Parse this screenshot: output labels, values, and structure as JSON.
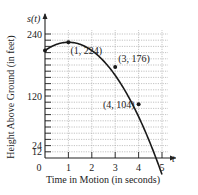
{
  "chart_data": {
    "type": "line",
    "title": "",
    "xlabel": "Time in Motion (in seconds)",
    "ylabel": "Height Above Ground (in feet)",
    "x_axis_symbol": "t",
    "y_axis_symbol": "s(t)",
    "xlim": [
      0,
      5
    ],
    "ylim": [
      0,
      240
    ],
    "x_ticks": [
      0,
      1,
      2,
      3,
      4,
      5
    ],
    "x_tick_labels": [
      "0",
      "1",
      "2",
      "3",
      "4",
      "5"
    ],
    "y_ticks": [
      0,
      12,
      24,
      120,
      240
    ],
    "y_tick_labels": [
      "0",
      "12",
      "24",
      "120",
      "240"
    ],
    "y_grid_step": 12,
    "x_grid_step": 1,
    "grid": true,
    "function": "s(t) = -16t^2 + 32t + 208",
    "series": [
      {
        "name": "s(t)",
        "x": [
          0,
          0.5,
          1,
          1.5,
          2,
          2.5,
          3,
          3.5,
          4,
          4.5,
          5
        ],
        "values": [
          208,
          220,
          224,
          220,
          208,
          188,
          176,
          140,
          104,
          58,
          0
        ]
      }
    ],
    "annotations": [
      {
        "label": "(1, 224)",
        "x": 1,
        "y": 224
      },
      {
        "label": "(3, 176)",
        "x": 3,
        "y": 176
      },
      {
        "label": "(4, 104)",
        "x": 4,
        "y": 104
      }
    ],
    "line_color": "#1a1a1a",
    "grid_color": "#9a9a9a"
  }
}
